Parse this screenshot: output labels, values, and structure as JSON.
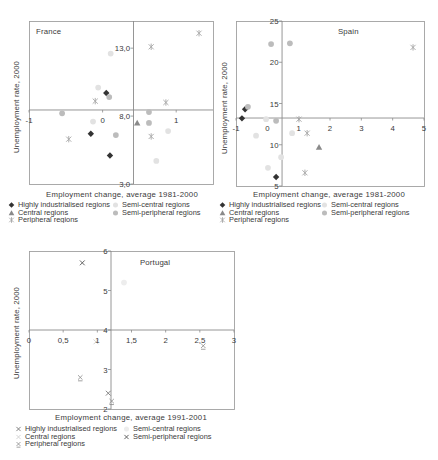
{
  "chart_data": [
    {
      "type": "scatter",
      "title": "France",
      "xlabel": "Employment change, average 1981-2000",
      "ylabel": "Unemployment rate, 2000",
      "xlim": [
        -1,
        1.5
      ],
      "ylim": [
        3,
        15
      ],
      "axis_cross": {
        "x": 0.42,
        "y": 8.45
      },
      "x_ticks": [
        {
          "v": -1,
          "label": "-1"
        },
        {
          "v": 0,
          "label": "0"
        },
        {
          "v": 1,
          "label": "1"
        }
      ],
      "y_ticks": [
        {
          "v": 13,
          "label": "13,0"
        },
        {
          "v": 8,
          "label": "8,0"
        },
        {
          "v": 3,
          "label": "3,0"
        }
      ],
      "grid": false,
      "legend_position": "bottom",
      "series": [
        {
          "name": "Highly industrialised regions",
          "marker": "diamond",
          "color": "#333333",
          "points": [
            [
              0.05,
              9.7
            ],
            [
              -0.16,
              6.7
            ],
            [
              0.1,
              5.1
            ]
          ]
        },
        {
          "name": "Semi-central regions",
          "marker": "circle",
          "color": "#e2e2e2",
          "points": [
            [
              -0.06,
              10.1
            ],
            [
              -0.13,
              7.6
            ],
            [
              0.11,
              12.6
            ],
            [
              0.89,
              6.9
            ],
            [
              0.73,
              4.7
            ]
          ]
        },
        {
          "name": "Central regions",
          "marker": "triangle",
          "color": "#8a8a8a",
          "points": [
            [
              0.47,
              7.5
            ]
          ]
        },
        {
          "name": "Semi-peripheral regions",
          "marker": "circle",
          "color": "#bcbcbc",
          "points": [
            [
              0.09,
              9.4
            ],
            [
              -0.55,
              8.2
            ],
            [
              0.18,
              6.6
            ],
            [
              0.63,
              8.3
            ],
            [
              0.63,
              7.5
            ]
          ]
        },
        {
          "name": "Peripheral regions",
          "marker": "asterisk",
          "color": "#a6a6a6",
          "points": [
            [
              -0.1,
              9.1
            ],
            [
              -0.46,
              6.3
            ],
            [
              1.31,
              14.1
            ],
            [
              0.66,
              13.1
            ],
            [
              0.86,
              9.0
            ],
            [
              0.66,
              6.5
            ]
          ]
        }
      ]
    },
    {
      "type": "scatter",
      "title": "Spain",
      "xlabel": "Employment change, average 1981-2000",
      "ylabel": "Unemployment rate, 2000",
      "xlim": [
        -1,
        5
      ],
      "ylim": [
        5,
        25
      ],
      "axis_cross": {
        "x": 0.47,
        "y": 13.24
      },
      "x_ticks": [
        {
          "v": -1,
          "label": "-1"
        },
        {
          "v": 0,
          "label": "0"
        },
        {
          "v": 1,
          "label": "1"
        },
        {
          "v": 2,
          "label": "2"
        },
        {
          "v": 3,
          "label": "3"
        },
        {
          "v": 4,
          "label": "4"
        },
        {
          "v": 5,
          "label": "5"
        }
      ],
      "y_ticks": [
        {
          "v": 25,
          "label": "25"
        },
        {
          "v": 20,
          "label": "20"
        },
        {
          "v": 15,
          "label": "15"
        },
        {
          "v": 10,
          "label": "10"
        },
        {
          "v": 5,
          "label": "5"
        }
      ],
      "grid": false,
      "legend_position": "bottom",
      "series": [
        {
          "name": "Highly industrialised regions",
          "marker": "diamond",
          "color": "#333333",
          "points": [
            [
              -0.71,
              14.3
            ],
            [
              -0.81,
              13.2
            ],
            [
              0.28,
              6.1
            ]
          ]
        },
        {
          "name": "Semi-central regions",
          "marker": "circle",
          "color": "#e2e2e2",
          "points": [
            [
              -0.04,
              13.1
            ],
            [
              -0.36,
              11.1
            ],
            [
              0.79,
              11.4
            ],
            [
              0.44,
              8.5
            ],
            [
              0.02,
              7.2
            ]
          ]
        },
        {
          "name": "Central regions",
          "marker": "triangle",
          "color": "#8a8a8a",
          "points": [
            [
              1.65,
              9.7
            ]
          ]
        },
        {
          "name": "Semi-peripheral regions",
          "marker": "circle",
          "color": "#bcbcbc",
          "points": [
            [
              -0.62,
              14.6
            ],
            [
              0.12,
              22.2
            ],
            [
              0.72,
              22.3
            ],
            [
              0.28,
              12.9
            ]
          ]
        },
        {
          "name": "Peripheral regions",
          "marker": "asterisk",
          "color": "#a6a6a6",
          "points": [
            [
              1.01,
              13.1
            ],
            [
              1.27,
              11.4
            ],
            [
              1.2,
              6.6
            ],
            [
              4.65,
              21.8
            ]
          ]
        }
      ]
    },
    {
      "type": "scatter",
      "title": "Portugal",
      "xlabel": "Employment change, average 1991-2001",
      "ylabel": "Unemployment rate, 2000",
      "xlim": [
        0,
        3
      ],
      "ylim": [
        2,
        6
      ],
      "axis_cross": {
        "x": 1.2,
        "y": 4
      },
      "x_ticks": [
        {
          "v": 0,
          "label": "0"
        },
        {
          "v": 0.5,
          "label": "0,5"
        },
        {
          "v": 1,
          "label": "1"
        },
        {
          "v": 1.5,
          "label": "1,5"
        },
        {
          "v": 2,
          "label": "2"
        },
        {
          "v": 2.5,
          "label": "2,5"
        },
        {
          "v": 3,
          "label": "3"
        }
      ],
      "y_ticks": [
        {
          "v": 6,
          "label": "6"
        },
        {
          "v": 5,
          "label": "5"
        },
        {
          "v": 4,
          "label": "4"
        },
        {
          "v": 3,
          "label": "3"
        },
        {
          "v": 2,
          "label": "2"
        }
      ],
      "grid": false,
      "legend_position": "bottom",
      "series": [
        {
          "name": "Highly industrialised regions",
          "marker": "cross",
          "color": "#777777",
          "points": [
            [
              1.16,
              2.4
            ]
          ]
        },
        {
          "name": "Semi-central regions",
          "marker": "circle",
          "color": "#ededed",
          "points": [
            [
              1.39,
              5.2
            ]
          ]
        },
        {
          "name": "Central regions",
          "marker": "cross",
          "color": "#d0d0d0",
          "points": [
            [
              0.98,
              3.7
            ]
          ]
        },
        {
          "name": "Semi-peripheral regions",
          "marker": "cross",
          "color": "#555555",
          "points": [
            [
              0.78,
              5.7
            ]
          ]
        },
        {
          "name": "Peripheral regions",
          "marker": "cross-bar",
          "color": "#8a8a8a",
          "points": [
            [
              0.75,
              2.8
            ],
            [
              1.21,
              2.2
            ],
            [
              2.55,
              3.6
            ]
          ]
        }
      ]
    }
  ]
}
